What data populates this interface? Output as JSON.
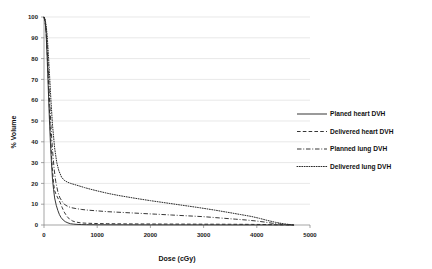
{
  "chart_data": {
    "type": "line",
    "title": "",
    "xlabel": "Dose (cGy)",
    "ylabel": "% Volume",
    "xlim": [
      0,
      5000
    ],
    "ylim": [
      0,
      100
    ],
    "xticks": [
      0,
      1000,
      2000,
      3000,
      4000,
      5000
    ],
    "xtick_labels": [
      "0",
      "1000",
      "2000",
      "3000",
      "4000",
      "5000"
    ],
    "yticks": [
      0,
      10,
      20,
      30,
      40,
      50,
      60,
      70,
      80,
      90,
      100
    ],
    "ytick_labels": [
      "0",
      "10",
      "20",
      "30",
      "40",
      "50",
      "60",
      "70",
      "80",
      "90",
      "100"
    ],
    "grid": "horizontal",
    "legend_position": "right",
    "series": [
      {
        "name": "Planed heart DVH",
        "style": "solid",
        "color": "#2b2b2b",
        "x": [
          0,
          20,
          40,
          60,
          80,
          100,
          120,
          140,
          160,
          180,
          200,
          230,
          260,
          290,
          320,
          360,
          400,
          450,
          500,
          560,
          620,
          700,
          800,
          1000,
          1500,
          2000,
          2500,
          3000,
          3500,
          4000,
          4300,
          4700
        ],
        "y": [
          100,
          98,
          92,
          80,
          66,
          52,
          40,
          30,
          22,
          17,
          13,
          9.5,
          7,
          5,
          3.6,
          2.4,
          1.6,
          1.0,
          0.6,
          0.4,
          0.3,
          0.2,
          0.15,
          0.1,
          0.08,
          0.06,
          0.05,
          0.04,
          0.03,
          0.02,
          0.01,
          0
        ]
      },
      {
        "name": "Delivered heart DVH",
        "style": "dashed",
        "color": "#2b2b2b",
        "x": [
          0,
          20,
          40,
          60,
          80,
          100,
          120,
          140,
          160,
          180,
          200,
          230,
          260,
          300,
          340,
          380,
          430,
          480,
          540,
          600,
          700,
          800,
          1000,
          1200,
          1500,
          2000,
          2500,
          3000,
          3500,
          3900,
          4200,
          4400,
          4700
        ],
        "y": [
          100,
          98,
          93,
          83,
          70,
          57,
          45,
          34,
          26,
          20,
          16.5,
          14.5,
          13,
          11,
          8.5,
          6.2,
          4.2,
          2.8,
          1.9,
          1.4,
          1.0,
          0.85,
          0.7,
          0.62,
          0.55,
          0.48,
          0.44,
          0.4,
          0.36,
          0.3,
          0.22,
          0.12,
          0
        ]
      },
      {
        "name": "Planned lung DVH",
        "style": "dashdot",
        "color": "#2b2b2b",
        "x": [
          0,
          20,
          40,
          60,
          80,
          100,
          130,
          160,
          190,
          220,
          260,
          300,
          350,
          400,
          460,
          520,
          600,
          700,
          800,
          1000,
          1200,
          1500,
          1800,
          2100,
          2400,
          2700,
          3000,
          3300,
          3600,
          3800,
          4000,
          4150,
          4300,
          4500,
          4700
        ],
        "y": [
          100,
          98,
          94,
          86,
          75,
          63,
          48,
          36,
          27,
          21,
          16,
          13,
          11,
          9.6,
          8.8,
          8.3,
          7.9,
          7.5,
          7.2,
          6.8,
          6.4,
          6.0,
          5.6,
          5.2,
          4.8,
          4.4,
          4.0,
          3.4,
          2.8,
          2.4,
          1.9,
          1.4,
          0.8,
          0.3,
          0
        ]
      },
      {
        "name": "Delivered lung DVH",
        "style": "dotted",
        "color": "#2b2b2b",
        "x": [
          0,
          20,
          40,
          60,
          80,
          100,
          130,
          160,
          200,
          240,
          280,
          330,
          380,
          440,
          500,
          580,
          660,
          760,
          860,
          1000,
          1200,
          1400,
          1700,
          2000,
          2300,
          2600,
          2900,
          3200,
          3500,
          3700,
          3900,
          4050,
          4200,
          4350,
          4500,
          4700
        ],
        "y": [
          100,
          99,
          96,
          91,
          83,
          74,
          60,
          48,
          37,
          30,
          26,
          23,
          21.5,
          20.6,
          20.0,
          19.4,
          18.8,
          18.0,
          17.3,
          16.4,
          15.2,
          14.2,
          12.9,
          11.7,
          10.6,
          9.5,
          8.4,
          7.2,
          5.9,
          5.0,
          4.1,
          3.2,
          2.2,
          1.3,
          0.6,
          0
        ]
      }
    ]
  },
  "legend": {
    "items": [
      {
        "label": "Planed heart DVH",
        "style": "solid"
      },
      {
        "label": "Delivered heart DVH",
        "style": "dashed"
      },
      {
        "label": "Planned lung DVH",
        "style": "dashdot"
      },
      {
        "label": "Delivered lung DVH",
        "style": "dotted"
      }
    ]
  },
  "colors": {
    "series": "#2b2b2b",
    "grid": "#d9d9d9",
    "axis": "#808080",
    "text": "#111111",
    "background": "#ffffff"
  }
}
